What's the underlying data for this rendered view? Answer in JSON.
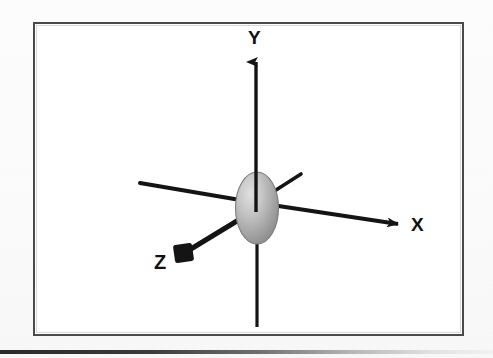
{
  "figure": {
    "kind": "3d-coordinate-axes-diagram",
    "background_color": "#fbfbfb",
    "frame": {
      "border_color": "#4a4a4a",
      "fill_color": "#ffffff",
      "x": 33,
      "y": 22,
      "width": 431,
      "height": 314
    },
    "origin_marker": {
      "name": "ellipsoid",
      "shape": "ellipse",
      "center_x": 257,
      "center_y": 208,
      "radius_x": 21,
      "radius_y": 36,
      "fill_light": "#d7d7d7",
      "fill_mid": "#ababab",
      "fill_dark": "#8d8d8d",
      "stroke_color": "#7a7a7a"
    },
    "stroke_color": "#1a1a1a",
    "axes": [
      {
        "id": "y-positive",
        "label": "Y",
        "label_x": 248,
        "label_y": 28,
        "has_arrowhead": true,
        "arrow_style": "triangle",
        "from_x": 256,
        "from_y": 196,
        "to_x": 256,
        "to_y": 52
      },
      {
        "id": "y-negative",
        "label": "",
        "has_arrowhead": false,
        "arrow_style": "none",
        "from_x": 257,
        "from_y": 222,
        "to_x": 257,
        "to_y": 327
      },
      {
        "id": "x-positive",
        "label": "X",
        "label_x": 411,
        "label_y": 215,
        "has_arrowhead": true,
        "arrow_style": "triangle",
        "from_x": 268,
        "from_y": 203,
        "to_x": 406,
        "to_y": 224
      },
      {
        "id": "x-negative",
        "label": "",
        "has_arrowhead": false,
        "arrow_style": "none",
        "from_x": 248,
        "from_y": 200,
        "to_x": 140,
        "to_y": 183
      },
      {
        "id": "z-positive",
        "label": "Z",
        "label_x": 154,
        "label_y": 252,
        "has_arrowhead": true,
        "arrow_style": "square-blob",
        "from_x": 251,
        "from_y": 214,
        "to_x": 184,
        "to_y": 254
      },
      {
        "id": "z-negative",
        "label": "",
        "has_arrowhead": false,
        "arrow_style": "none",
        "from_x": 266,
        "from_y": 196,
        "to_x": 301,
        "to_y": 174
      }
    ],
    "page_rule": {
      "present": true,
      "y": 350,
      "color": "#2a2a2a"
    }
  }
}
